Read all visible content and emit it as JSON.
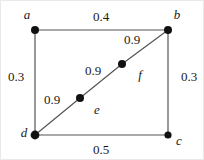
{
  "figure": {
    "type": "weighted-graph",
    "background_color": "#ffffff",
    "edge_color": "#555555",
    "node_color": "#111111",
    "text_color": "#1a1a1a",
    "width": 204,
    "height": 160
  },
  "nodes": [
    {
      "id": "a",
      "label": "a",
      "x": 34,
      "y": 29,
      "r": 4.0,
      "label_x": 26,
      "label_y": 13
    },
    {
      "id": "b",
      "label": "b",
      "x": 167,
      "y": 29,
      "r": 4.0,
      "label_x": 176,
      "label_y": 13
    },
    {
      "id": "c",
      "label": "c",
      "x": 167,
      "y": 134,
      "r": 3.6,
      "label_x": 178,
      "label_y": 139
    },
    {
      "id": "d",
      "label": "d",
      "x": 34,
      "y": 134,
      "r": 4.4,
      "label_x": 23,
      "label_y": 131
    },
    {
      "id": "e",
      "label": "e",
      "x": 79,
      "y": 97,
      "r": 4.0,
      "label_x": 96,
      "label_y": 108
    },
    {
      "id": "f",
      "label": "f",
      "x": 121,
      "y": 63,
      "r": 4.0,
      "label_x": 139,
      "label_y": 73
    }
  ],
  "edges": [
    {
      "id": "edge-ab",
      "from": "a",
      "to": "b",
      "weight": "0.4",
      "label_x": 100,
      "label_y": 15
    },
    {
      "id": "edge-ad",
      "from": "a",
      "to": "d",
      "weight": "0.3",
      "label_x": 15,
      "label_y": 75
    },
    {
      "id": "edge-bc",
      "from": "b",
      "to": "c",
      "weight": "0.3",
      "label_x": 188,
      "label_y": 75
    },
    {
      "id": "edge-dc",
      "from": "d",
      "to": "c",
      "weight": "0.5",
      "label_x": 100,
      "label_y": 148
    },
    {
      "id": "edge-de",
      "from": "d",
      "to": "e",
      "weight": "0.9",
      "label_x": 51,
      "label_y": 98
    },
    {
      "id": "edge-ef",
      "from": "e",
      "to": "f",
      "weight": "0.9",
      "label_x": 92,
      "label_y": 69
    },
    {
      "id": "edge-fb",
      "from": "f",
      "to": "b",
      "weight": "0.9",
      "label_x": 131,
      "label_y": 38
    }
  ]
}
